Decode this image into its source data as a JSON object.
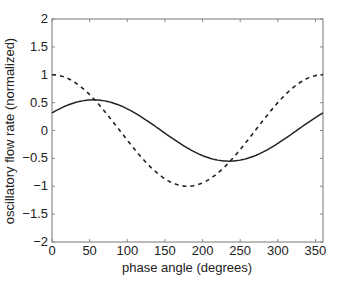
{
  "chart_data": {
    "type": "line",
    "title": "",
    "xlabel": "phase angle (degrees)",
    "ylabel": "oscillatory flow rate (normalized)",
    "xlim": [
      0,
      360
    ],
    "ylim": [
      -2,
      2
    ],
    "xticks": [
      0,
      50,
      100,
      150,
      200,
      250,
      300,
      350
    ],
    "yticks": [
      2,
      1.5,
      1,
      0.5,
      0,
      -0.5,
      -1,
      -1.5,
      -2
    ],
    "ytick_labels": [
      "2",
      "1.5",
      "1",
      "0.5",
      "0",
      "−0.5",
      "−1",
      "−1.5",
      "−2"
    ],
    "grid": false,
    "legend": null,
    "series": [
      {
        "name": "solid",
        "style": "solid",
        "amplitude": 0.55,
        "phase_deg": 55,
        "x": [
          0,
          30,
          60,
          90,
          120,
          150,
          180,
          210,
          240,
          270,
          300,
          330,
          360
        ],
        "values": [
          0.32,
          0.5,
          0.55,
          0.45,
          0.23,
          -0.05,
          -0.32,
          -0.5,
          -0.55,
          -0.45,
          -0.23,
          0.05,
          0.32
        ]
      },
      {
        "name": "dashed",
        "style": "dashed",
        "amplitude": 1.0,
        "phase_deg": 0,
        "x": [
          0,
          30,
          60,
          90,
          120,
          150,
          180,
          210,
          240,
          270,
          300,
          330,
          360
        ],
        "values": [
          1.0,
          0.87,
          0.5,
          0.0,
          -0.5,
          -0.87,
          -1.0,
          -0.87,
          -0.5,
          0.0,
          0.5,
          0.87,
          1.0
        ]
      }
    ]
  }
}
